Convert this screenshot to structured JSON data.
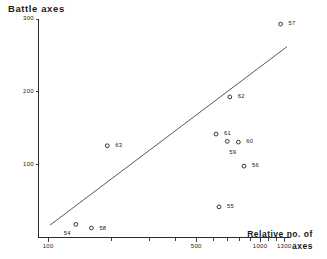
{
  "chart_data": {
    "type": "scatter",
    "title": "Battle axes",
    "xlabel_line1": "Relative no. of",
    "xlabel_line2": "axes",
    "ylabel": "Battle axes",
    "xscale": "log",
    "yscale": "linear",
    "xlim": [
      90,
      1400
    ],
    "ylim": [
      0,
      300
    ],
    "grid": false,
    "legend": "none",
    "xticks": [
      {
        "label": "100",
        "value": 100
      },
      {
        "label": "500",
        "value": 500
      },
      {
        "label": "1000",
        "value": 1000
      },
      {
        "label": "1300",
        "value": 1300
      }
    ],
    "yticks": [
      {
        "label": "300",
        "value": 300
      },
      {
        "label": "200",
        "value": 200
      },
      {
        "label": "100",
        "value": 100
      }
    ],
    "points": [
      {
        "label": "57",
        "x": 1250,
        "y": 293,
        "lx": 8,
        "ly": -3
      },
      {
        "label": "62",
        "x": 720,
        "y": 193,
        "lx": 8,
        "ly": -3
      },
      {
        "label": "61",
        "x": 620,
        "y": 142,
        "lx": 8,
        "ly": -3
      },
      {
        "label": "59",
        "x": 700,
        "y": 132,
        "lx": 2,
        "ly": 9
      },
      {
        "label": "60",
        "x": 790,
        "y": 131,
        "lx": 8,
        "ly": -3
      },
      {
        "label": "63",
        "x": 190,
        "y": 126,
        "lx": 8,
        "ly": -3
      },
      {
        "label": "56",
        "x": 840,
        "y": 98,
        "lx": 8,
        "ly": -3
      },
      {
        "label": "55",
        "x": 640,
        "y": 42,
        "lx": 8,
        "ly": -3
      },
      {
        "label": "58",
        "x": 160,
        "y": 13,
        "lx": 8,
        "ly": -2
      },
      {
        "label": "54",
        "x": 135,
        "y": 18,
        "lx": -12,
        "ly": 7
      }
    ],
    "trend_line": {
      "name": "fitted-regression-line",
      "x1": 102,
      "y1": 17,
      "x2": 1340,
      "y2": 262
    }
  }
}
